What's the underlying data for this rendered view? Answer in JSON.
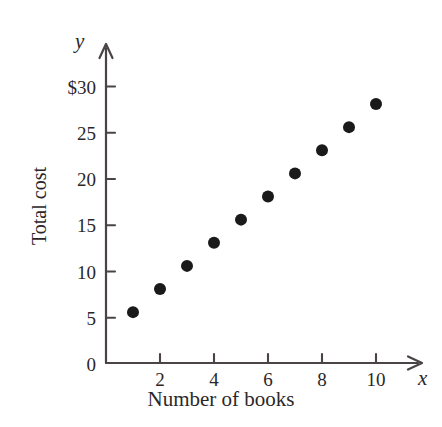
{
  "chart_data": {
    "type": "scatter",
    "title": "",
    "xlabel": "Number of books",
    "ylabel": "Total cost",
    "x_axis_variable": "x",
    "y_axis_variable": "y",
    "grid": false,
    "legend": "none",
    "xlim": [
      0,
      11.6
    ],
    "ylim": [
      0,
      32.5
    ],
    "x_ticks": [
      0,
      2,
      4,
      6,
      8,
      10
    ],
    "x_tick_labels": [
      "0",
      "2",
      "4",
      "6",
      "8",
      "10"
    ],
    "x_minor_ticks": [
      1,
      3,
      5,
      7,
      9
    ],
    "y_ticks": [
      0,
      5,
      10,
      15,
      20,
      25,
      30
    ],
    "y_tick_labels": [
      "0",
      "5",
      "10",
      "15",
      "20",
      "25",
      "$30"
    ],
    "x": [
      1,
      2,
      3,
      4,
      5,
      6,
      7,
      8,
      9,
      10
    ],
    "values": [
      5.5,
      8,
      10.5,
      13,
      15.5,
      18,
      20.5,
      23,
      25.5,
      28
    ],
    "points": [
      {
        "x": 1,
        "y": 5.5
      },
      {
        "x": 2,
        "y": 8
      },
      {
        "x": 3,
        "y": 10.5
      },
      {
        "x": 4,
        "y": 13
      },
      {
        "x": 5,
        "y": 15.5
      },
      {
        "x": 6,
        "y": 18
      },
      {
        "x": 7,
        "y": 20.5
      },
      {
        "x": 8,
        "y": 23
      },
      {
        "x": 9,
        "y": 25.5
      },
      {
        "x": 10,
        "y": 28
      }
    ],
    "marker": {
      "shape": "circle",
      "color": "#1a1a1a",
      "radius_px": 6
    },
    "axis_color": "#4a4446",
    "axis_arrow_heads": [
      "x",
      "y"
    ]
  },
  "geometry": {
    "origin_x_px": 106,
    "origin_y_px": 363,
    "x_unit_px": 27,
    "y_unit_px": 9.25
  }
}
